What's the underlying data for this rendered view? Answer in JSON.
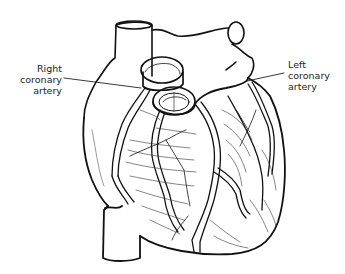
{
  "diagram": {
    "style": "black-line-drawing",
    "labels": [
      {
        "id": "right-coronary-artery",
        "lines": [
          "Right",
          "coronary",
          "artery"
        ]
      },
      {
        "id": "left-coronary-artery",
        "lines": [
          "Left",
          "coronary",
          "artery"
        ]
      }
    ],
    "colors": {
      "line": "#111111",
      "background": "#ffffff",
      "label": "#222222"
    }
  }
}
